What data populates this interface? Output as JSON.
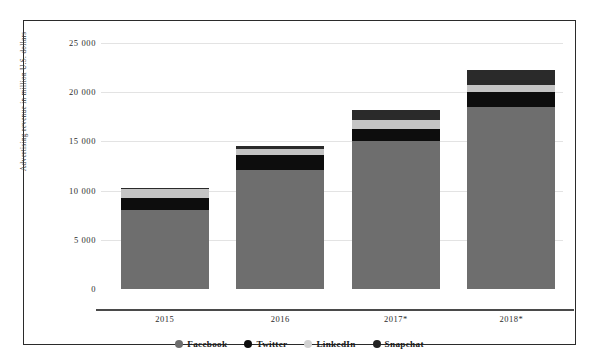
{
  "chart_data": {
    "type": "bar",
    "stacked": true,
    "title": "",
    "xlabel": "",
    "ylabel": "Advertising revenue in million U.S. dollars",
    "categories": [
      "2015",
      "2016",
      "2017*",
      "2018*"
    ],
    "ylim": [
      0,
      25000
    ],
    "yticks": [
      0,
      5000,
      10000,
      15000,
      20000,
      25000
    ],
    "ytick_labels": [
      "0",
      "5 000",
      "10 000",
      "15 000",
      "20 000",
      "25 000"
    ],
    "grid": true,
    "legend_position": "bottom",
    "series": [
      {
        "name": "Facebook",
        "color": "#6e6e6e",
        "values": [
          8000,
          12100,
          15000,
          18500
        ]
      },
      {
        "name": "Twitter",
        "color": "#0d0d0d",
        "values": [
          1300,
          1500,
          1300,
          1500
        ]
      },
      {
        "name": "LinkedIn",
        "color": "#c4c4c4",
        "values": [
          900,
          600,
          900,
          700
        ]
      },
      {
        "name": "Snapchat",
        "color": "#2a2a2a",
        "values": [
          60,
          370,
          1000,
          1600
        ]
      }
    ],
    "totals": [
      10260,
      14570,
      18200,
      22300
    ]
  },
  "legend": {
    "items": [
      {
        "label": "Facebook"
      },
      {
        "label": "Twitter"
      },
      {
        "label": "LinkedIn"
      },
      {
        "label": "Snapchat"
      }
    ]
  }
}
